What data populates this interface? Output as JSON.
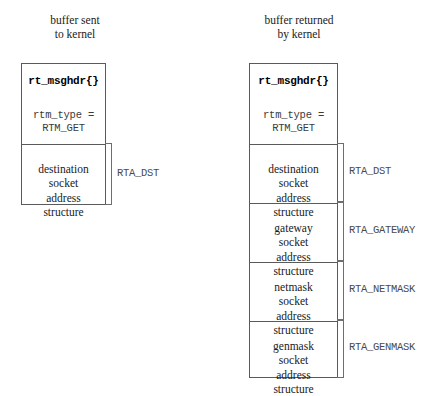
{
  "diagram": {
    "columns": [
      {
        "id": "sent",
        "caption": "buffer sent\nto kernel",
        "header": {
          "struct_name": "rt_msghdr{}",
          "field": "rtm_type =\n  RTM_GET"
        },
        "sections": [
          {
            "text": "destination\nsocket\naddress\nstructure",
            "label": "RTA_DST"
          }
        ]
      },
      {
        "id": "returned",
        "caption": "buffer returned\nby kernel",
        "header": {
          "struct_name": "rt_msghdr{}",
          "field": "rtm_type =\n  RTM_GET"
        },
        "sections": [
          {
            "text": "destination\nsocket\naddress\nstructure",
            "label": "RTA_DST"
          },
          {
            "text": "gateway\nsocket\naddress\nstructure",
            "label": "RTA_GATEWAY"
          },
          {
            "text": "netmask\nsocket\naddress\nstructure",
            "label": "RTA_NETMASK"
          },
          {
            "text": "genmask\nsocket\naddress\nstructure",
            "label": "RTA_GENMASK"
          }
        ]
      }
    ],
    "colors": {
      "background": "#ffffff",
      "border": "#5a5a5a",
      "brace": "#6e6e6e",
      "text": "#1a1a1a",
      "mono_text": "#3c3c3c"
    }
  }
}
